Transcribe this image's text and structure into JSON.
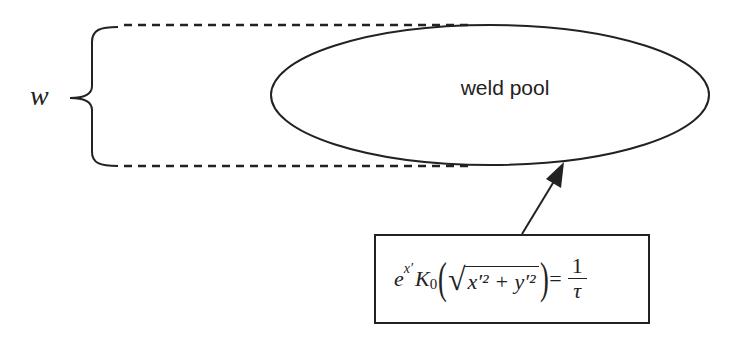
{
  "diagram": {
    "width_label": "w",
    "pool_label": "weld pool",
    "equation": {
      "base": "e",
      "exponent": "x′",
      "bessel": "K",
      "bessel_sub": "0",
      "radicand": "x′² + y′²",
      "equals": "=",
      "numerator": "1",
      "denominator": "τ"
    },
    "colors": {
      "stroke": "#222222",
      "background": "#ffffff"
    }
  }
}
